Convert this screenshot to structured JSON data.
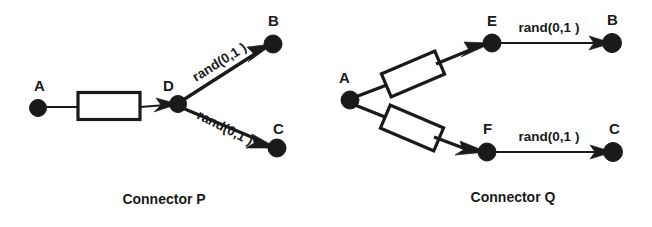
{
  "figure": {
    "background_color": "#ffffff",
    "ink_color": "#1a1a1a",
    "panels": [
      {
        "id": "connector-p",
        "caption": "Connector P",
        "caption_x": 164,
        "caption_y": 204,
        "nodes": [
          {
            "id": "p-a",
            "label": "A",
            "cx": 38,
            "cy": 108,
            "r": 8.5,
            "label_x": 34,
            "label_y": 91
          },
          {
            "id": "p-d",
            "label": "D",
            "cx": 178,
            "cy": 104,
            "r": 8.5,
            "label_x": 163,
            "label_y": 91
          },
          {
            "id": "p-b",
            "label": "B",
            "cx": 273,
            "cy": 44,
            "r": 9.0,
            "label_x": 268,
            "label_y": 26
          },
          {
            "id": "p-c",
            "label": "C",
            "cx": 277,
            "cy": 148,
            "r": 9.0,
            "label_x": 273,
            "label_y": 134
          }
        ],
        "boxes": [
          {
            "id": "p-box-ad",
            "cx": 109,
            "cy": 106,
            "w": 62,
            "h": 27,
            "rotate": 0
          }
        ],
        "edges": [
          {
            "id": "p-edge-a-d",
            "from": "A",
            "to": "D",
            "label": "",
            "arrow": true
          },
          {
            "id": "p-edge-d-b",
            "from": "D",
            "to": "B",
            "label": "rand(0,1 )",
            "arrow": true,
            "label_x": 196,
            "label_y": 82,
            "label_rotate": -32
          },
          {
            "id": "p-edge-d-c",
            "from": "D",
            "to": "C",
            "label": "rand(0,1 )",
            "arrow": true,
            "label_x": 196,
            "label_y": 118,
            "label_rotate": 27
          }
        ]
      },
      {
        "id": "connector-q",
        "caption": "Connector Q",
        "caption_x": 513,
        "caption_y": 202,
        "nodes": [
          {
            "id": "q-a",
            "label": "A",
            "cx": 350,
            "cy": 100,
            "r": 9.0,
            "label_x": 339,
            "label_y": 83
          },
          {
            "id": "q-e",
            "label": "E",
            "cx": 492,
            "cy": 43,
            "r": 9.0,
            "label_x": 487,
            "label_y": 26
          },
          {
            "id": "q-b",
            "label": "B",
            "cx": 612,
            "cy": 43,
            "r": 9.5,
            "label_x": 607,
            "label_y": 25
          },
          {
            "id": "q-f",
            "label": "F",
            "cx": 487,
            "cy": 152,
            "r": 9.0,
            "label_x": 483,
            "label_y": 134
          },
          {
            "id": "q-c",
            "label": "C",
            "cx": 613,
            "cy": 152,
            "r": 9.5,
            "label_x": 609,
            "label_y": 134
          }
        ],
        "boxes": [
          {
            "id": "q-box-ae",
            "cx": 413,
            "cy": 74,
            "w": 58,
            "h": 25,
            "rotate": -23
          },
          {
            "id": "q-box-af",
            "cx": 412,
            "cy": 128,
            "w": 58,
            "h": 25,
            "rotate": 23
          }
        ],
        "edges": [
          {
            "id": "q-edge-a-e",
            "from": "A",
            "to": "E",
            "label": "",
            "arrow": true
          },
          {
            "id": "q-edge-a-f",
            "from": "A",
            "to": "F",
            "label": "",
            "arrow": true
          },
          {
            "id": "q-edge-e-b",
            "from": "E",
            "to": "B",
            "label": "rand(0,1 )",
            "arrow": true,
            "label_x": 549,
            "label_y": 32,
            "label_rotate": 0
          },
          {
            "id": "q-edge-f-c",
            "from": "F",
            "to": "C",
            "label": "rand(0,1 )",
            "arrow": true,
            "label_x": 549,
            "label_y": 141,
            "label_rotate": 0
          }
        ]
      }
    ]
  }
}
